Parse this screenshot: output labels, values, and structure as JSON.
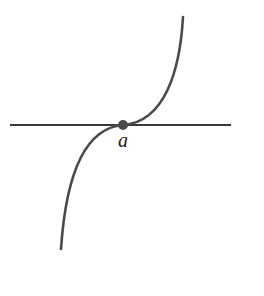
{
  "diagram": {
    "axis": {
      "x1": 10,
      "y1": 125,
      "x2": 231,
      "y2": 125
    },
    "point": {
      "label": "a",
      "cx": 123,
      "cy": 125,
      "r": 5
    },
    "curve": {
      "path": "M 183 17 C 180 70, 165 122, 123 125 C 85 128, 66 175, 61 249"
    },
    "colors": {
      "axis": "#3a3a3a",
      "curve": "#4a4a4a",
      "point": "#4a4a4a",
      "label": "#222222",
      "background": "#ffffff"
    }
  }
}
